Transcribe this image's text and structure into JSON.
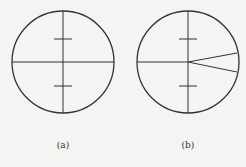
{
  "figures": [
    {
      "id": "a",
      "label": "(a)",
      "circle": {
        "cx": 63,
        "cy": 62,
        "r": 51
      },
      "ticks": [
        {
          "y": 39,
          "half": 9
        },
        {
          "y": 86,
          "half": 9
        }
      ],
      "wedge": null
    },
    {
      "id": "b",
      "label": "(b)",
      "circle": {
        "cx": 188,
        "cy": 62,
        "r": 51
      },
      "ticks": [
        {
          "y": 39,
          "half": 9
        },
        {
          "y": 86,
          "half": 9
        }
      ],
      "wedge": [
        {
          "x": 237,
          "y": 53
        },
        {
          "x": 237,
          "y": 72
        }
      ]
    }
  ],
  "colors": {
    "stroke": "#333333",
    "background": "#f4f4f2"
  }
}
